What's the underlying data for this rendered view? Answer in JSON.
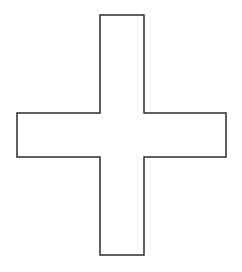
{
  "diagram": {
    "shape": "plus-cross",
    "background": "#ffffff",
    "fill": "#ffffff",
    "stroke": "#2b2b2b",
    "stroke_width": 1.5,
    "vertical_bar": {
      "x1": 100,
      "x2": 144,
      "y1": 15,
      "y2": 255
    },
    "horizontal_bar": {
      "x1": 17,
      "x2": 226,
      "y1": 113,
      "y2": 157
    }
  }
}
